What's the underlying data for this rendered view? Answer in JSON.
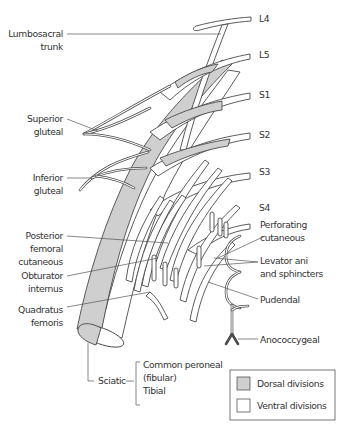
{
  "diagram": {
    "roots": [
      {
        "id": "L4",
        "label": "L4"
      },
      {
        "id": "L5",
        "label": "L5"
      },
      {
        "id": "S1",
        "label": "S1"
      },
      {
        "id": "S2",
        "label": "S2"
      },
      {
        "id": "S3",
        "label": "S3"
      },
      {
        "id": "S4",
        "label": "S4"
      }
    ],
    "left_labels": {
      "lumbosacral_trunk": [
        "Lumbosacral",
        "trunk"
      ],
      "superior_gluteal": [
        "Superior",
        "gluteal"
      ],
      "inferior_gluteal": [
        "Inferior",
        "gluteal"
      ],
      "posterior_femoral_cutaneous": [
        "Posterior",
        "femoral",
        "cutaneous"
      ],
      "obturator_internus": [
        "Obturator",
        "internus"
      ],
      "quadratus_femoris": [
        "Quadratus",
        "femoris"
      ]
    },
    "right_labels": {
      "perforating_cutaneous": [
        "Perforating",
        "cutaneous"
      ],
      "levator_ani": [
        "Levator ani",
        "and sphincters"
      ],
      "pudendal": [
        "Pudendal"
      ],
      "anococcygeal": [
        "Anococcygeal"
      ]
    },
    "sciatic": {
      "label": "Sciatic",
      "branches": [
        "Common peroneal",
        "(fibular)",
        "Tibial"
      ]
    },
    "legend": {
      "items": [
        {
          "label": "Dorsal divisions",
          "color": "#cfcfcf"
        },
        {
          "label": "Ventral divisions",
          "color": "#ffffff"
        }
      ]
    },
    "colors": {
      "dorsal_fill": "#cfcfcf",
      "ventral_fill": "#ffffff",
      "outline": "#4a4a4a",
      "text": "#333333"
    }
  }
}
